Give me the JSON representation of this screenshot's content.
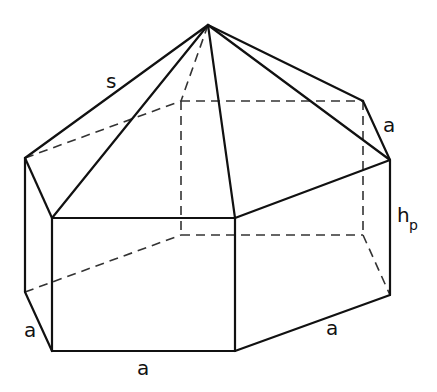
{
  "figure": {
    "labels": {
      "slant_edge": "s",
      "top_right_edge": "a",
      "height_main": "h",
      "height_sub": "p",
      "bottom_left_edge": "a",
      "bottom_front_edge": "a",
      "bottom_right_edge": "a"
    },
    "colors": {
      "stroke": "#111111",
      "background": "#ffffff"
    }
  }
}
